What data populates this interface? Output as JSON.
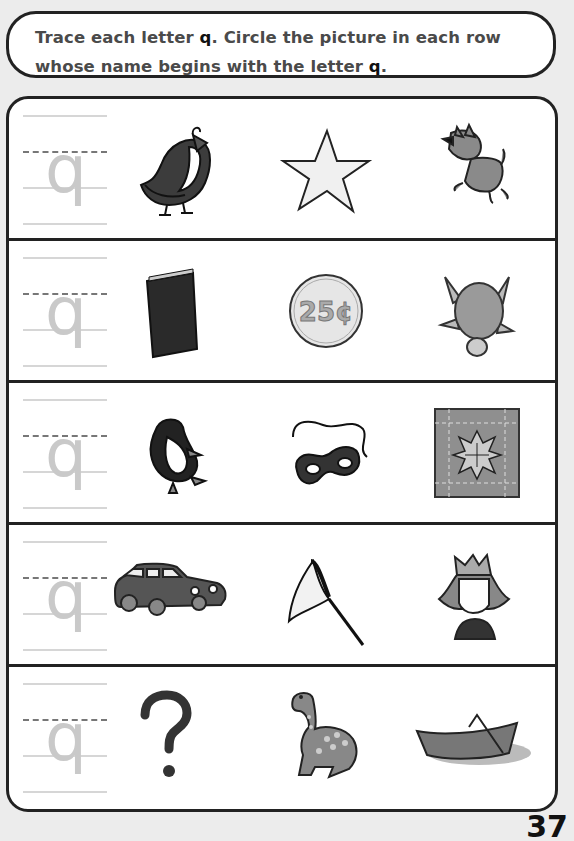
{
  "instructions": {
    "line1_pre": "Trace each letter ",
    "line1_letter": "q",
    "line1_post": ". Circle the picture in each row",
    "line2_pre": "whose name begins with the letter ",
    "line2_letter": "q",
    "line2_post": "."
  },
  "trace_letter": "q",
  "rows": [
    {
      "pictures": [
        "quail",
        "star",
        "dog"
      ]
    },
    {
      "pictures": [
        "book",
        "quarter",
        "turtle"
      ]
    },
    {
      "pictures": [
        "penguin",
        "mask",
        "quilt"
      ]
    },
    {
      "pictures": [
        "car",
        "net",
        "queen"
      ]
    },
    {
      "pictures": [
        "question-mark",
        "dinosaur",
        "boat"
      ]
    }
  ],
  "coin_label": "25¢",
  "page_number": "37"
}
